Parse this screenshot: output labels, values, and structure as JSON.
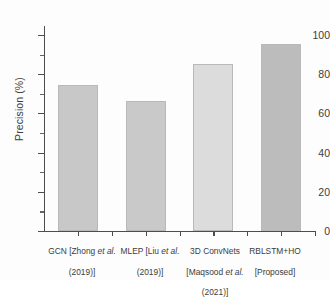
{
  "chart_data": {
    "type": "bar",
    "title": "",
    "xlabel": "",
    "ylabel": "Precision (%)",
    "ylim": [
      0,
      104
    ],
    "ytick_values": [
      0,
      20,
      40,
      60,
      80,
      100
    ],
    "ytick_labels": [
      "0",
      "20",
      "40",
      "60",
      "80",
      "100"
    ],
    "yminor_values": [
      10,
      30,
      50,
      70,
      90
    ],
    "grid": false,
    "legend": null,
    "categories": [
      "GCN [Zhong et al. (2019)]",
      "MLEP [Liu et al. (2019)]",
      "3D ConvNets [Maqsood et al. (2021)]",
      "RBLSTM+HO [Proposed]"
    ],
    "category_lines": [
      [
        "GCN [Zhong ",
        "et al.",
        "",
        "(2019)]"
      ],
      [
        "MLEP [Liu ",
        "et al.",
        "",
        "(2019)]"
      ],
      [
        "3D ConvNets",
        "",
        "[Maqsood ",
        "et al.",
        "(2021)]"
      ],
      [
        "RBLSTM+HO",
        "[Proposed]"
      ]
    ],
    "values": [
      74.5,
      66.5,
      85.0,
      95.5
    ],
    "bar_colors": [
      "#c8c8c8",
      "#c9c9c9",
      "#dcdcdc",
      "#bcbcbc"
    ],
    "bar_edge_color": "#b9b9b9",
    "axis_color": "#4d4d4d",
    "text_color": "#3c3c3c",
    "background": "#fdfdfd"
  },
  "labels": {
    "cat0_l1_a": "GCN [Zhong ",
    "cat0_l1_b": "et al.",
    "cat0_l2": "(2019)]",
    "cat1_l1_a": "MLEP [Liu ",
    "cat1_l1_b": "et al.",
    "cat1_l2": "(2019)]",
    "cat2_l1": "3D ConvNets",
    "cat2_l2_a": "[Maqsood ",
    "cat2_l2_b": "et al.",
    "cat2_l3": "(2021)]",
    "cat3_l1": "RBLSTM+HO",
    "cat3_l2": "[Proposed]"
  }
}
